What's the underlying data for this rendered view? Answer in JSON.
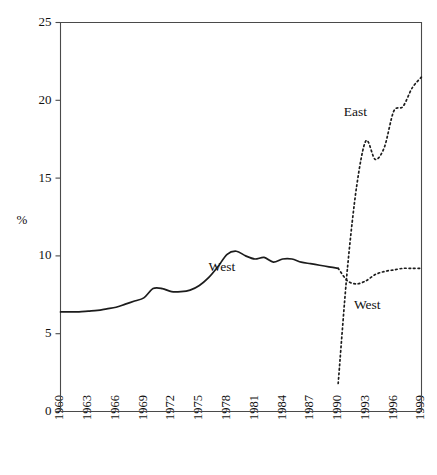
{
  "chart_data": {
    "type": "line",
    "title": "",
    "subtitle": "",
    "xlabel": "",
    "ylabel": "%",
    "xlim": [
      1960,
      1999
    ],
    "ylim": [
      0,
      25
    ],
    "grid": false,
    "legend_position": "inline-annotations",
    "y_ticks": [
      0,
      5,
      10,
      15,
      20,
      25
    ],
    "y_tick_labels": [
      "0",
      "5",
      "10",
      "15",
      "20",
      "25"
    ],
    "x_ticks": [
      1960,
      1963,
      1966,
      1969,
      1972,
      1975,
      1978,
      1981,
      1984,
      1987,
      1990,
      1993,
      1996,
      1999
    ],
    "x_tick_labels": [
      "1960",
      "1963",
      "1966",
      "1969",
      "1972",
      "1975",
      "1978",
      "1981",
      "1984",
      "1987",
      "1990",
      "1993",
      "1996",
      "1999"
    ],
    "annotations": [
      {
        "text": "West",
        "x": 1976.0,
        "y": 9.0,
        "series": "West"
      },
      {
        "text": "East",
        "x": 1990.6,
        "y": 19.0,
        "series": "East"
      },
      {
        "text": "West",
        "x": 1991.7,
        "y": 6.6,
        "series": "West"
      }
    ],
    "series": [
      {
        "name": "West",
        "style": "solid",
        "x": [
          1960,
          1961,
          1962,
          1963,
          1964,
          1965,
          1966,
          1967,
          1968,
          1969,
          1970,
          1971,
          1972,
          1973,
          1974,
          1975,
          1976,
          1977,
          1978,
          1979,
          1980,
          1981,
          1982,
          1983,
          1984,
          1985,
          1986,
          1987,
          1988,
          1989,
          1990
        ],
        "values": [
          6.4,
          6.4,
          6.4,
          6.45,
          6.5,
          6.6,
          6.7,
          6.9,
          7.1,
          7.3,
          7.9,
          7.9,
          7.7,
          7.7,
          7.8,
          8.1,
          8.6,
          9.3,
          10.1,
          10.3,
          10.0,
          9.8,
          9.9,
          9.6,
          9.8,
          9.8,
          9.6,
          9.5,
          9.4,
          9.3,
          9.2
        ]
      },
      {
        "name": "West",
        "style": "dotted",
        "x": [
          1990,
          1991,
          1992,
          1993,
          1994,
          1995,
          1996,
          1997,
          1998,
          1999
        ],
        "values": [
          9.2,
          8.4,
          8.2,
          8.4,
          8.8,
          9.0,
          9.1,
          9.2,
          9.2,
          9.2
        ]
      },
      {
        "name": "East",
        "style": "dotted",
        "x": [
          1990,
          1991,
          1992,
          1993,
          1994,
          1995,
          1996,
          1997,
          1998,
          1999
        ],
        "values": [
          1.8,
          9.2,
          14.5,
          17.4,
          16.2,
          17.0,
          19.3,
          19.6,
          20.8,
          21.5
        ]
      }
    ]
  }
}
